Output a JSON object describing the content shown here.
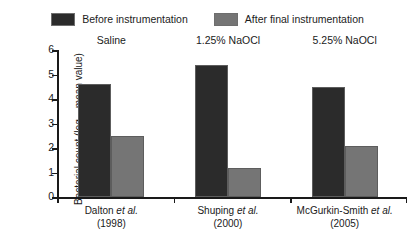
{
  "legend": {
    "items": [
      {
        "label": "Before instrumentation",
        "color": "#2b2b2b",
        "name": "before-instrumentation"
      },
      {
        "label": "After final instrumentation",
        "color": "#757575",
        "name": "after-final-instrumentation"
      }
    ]
  },
  "axes": {
    "y_title_main": "Bacterial count (log",
    "y_title_sub": "10",
    "y_title_tail": " mean value)",
    "y_ticks": [
      "0",
      "1",
      "2",
      "3",
      "4",
      "5",
      "6"
    ]
  },
  "groups": [
    {
      "title": "Saline",
      "study": "Dalton ",
      "study_italic": "et al.",
      "year": "(1998)"
    },
    {
      "title": "1.25% NaOCl",
      "study": "Shuping ",
      "study_italic": "et al.",
      "year": "(2000)"
    },
    {
      "title": "5.25% NaOCl",
      "study": "McGurkin-Smith ",
      "study_italic": "et al.",
      "year": "(2005)"
    }
  ],
  "chart_data": {
    "type": "bar",
    "title": "",
    "subtitle": "",
    "xlabel": "",
    "ylabel": "Bacterial count (log10 mean value)",
    "categories": [
      "Dalton et al. (1998)",
      "Shuping et al. (2000)",
      "McGurkin-Smith et al. (2005)"
    ],
    "group_titles": [
      "Saline",
      "1.25% NaOCl",
      "5.25% NaOCl"
    ],
    "series": [
      {
        "name": "Before instrumentation",
        "color": "#2b2b2b",
        "values": [
          4.6,
          5.4,
          4.5
        ]
      },
      {
        "name": "After final instrumentation",
        "color": "#757575",
        "values": [
          2.5,
          1.2,
          2.1
        ]
      }
    ],
    "ylim": [
      0,
      6
    ],
    "ytick_values": [
      0,
      1,
      2,
      3,
      4,
      5,
      6
    ],
    "grid": false,
    "legend_position": "top"
  }
}
